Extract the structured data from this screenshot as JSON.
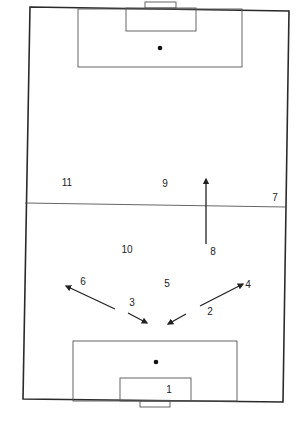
{
  "diagram": {
    "colors": {
      "background": "#ffffff",
      "lines": "#333333",
      "text": "#222222"
    },
    "pitch": {
      "corners": {
        "top_left": [
          30,
          7
        ],
        "top_right": [
          289,
          11
        ],
        "bottom_right": [
          283,
          402
        ],
        "bottom_left": [
          23,
          399
        ]
      },
      "halfway_line": {
        "from": [
          25,
          203
        ],
        "to": [
          286,
          207
        ]
      },
      "top": {
        "goal": {
          "x": 145,
          "y": 2,
          "w": 31,
          "h": 6
        },
        "goal_area": {
          "x": 126,
          "y": 8,
          "w": 70,
          "h": 23
        },
        "penalty_area": {
          "x": 78,
          "y": 9,
          "w": 164,
          "h": 58
        },
        "penalty_spot": [
          160,
          48
        ]
      },
      "bottom": {
        "goal": {
          "x": 140,
          "y": 401,
          "w": 30,
          "h": 6
        },
        "goal_area": {
          "x": 120,
          "y": 378,
          "w": 71,
          "h": 23
        },
        "penalty_area": {
          "x": 73,
          "y": 341,
          "w": 164,
          "h": 60
        },
        "penalty_spot": [
          156,
          362
        ]
      }
    },
    "players": [
      {
        "number": "1",
        "x": 169,
        "y": 393
      },
      {
        "number": "2",
        "x": 210,
        "y": 315
      },
      {
        "number": "3",
        "x": 132,
        "y": 306
      },
      {
        "number": "4",
        "x": 248,
        "y": 288
      },
      {
        "number": "5",
        "x": 167,
        "y": 287
      },
      {
        "number": "6",
        "x": 83,
        "y": 285
      },
      {
        "number": "7",
        "x": 275,
        "y": 201
      },
      {
        "number": "8",
        "x": 213,
        "y": 255
      },
      {
        "number": "9",
        "x": 165,
        "y": 187
      },
      {
        "number": "10",
        "x": 127,
        "y": 253
      },
      {
        "number": "11",
        "x": 67,
        "y": 186
      }
    ],
    "arrows": [
      {
        "player": "8",
        "from": [
          206,
          244
        ],
        "to": [
          206,
          179
        ]
      },
      {
        "player": "6",
        "from": [
          115,
          309
        ],
        "to": [
          66,
          286
        ]
      },
      {
        "player": "3",
        "from": [
          128,
          313
        ],
        "to": [
          147,
          323
        ]
      },
      {
        "player": "4",
        "from": [
          200,
          306
        ],
        "to": [
          243,
          284
        ]
      },
      {
        "player": "2",
        "from": [
          186,
          314
        ],
        "to": [
          168,
          324
        ]
      }
    ]
  }
}
